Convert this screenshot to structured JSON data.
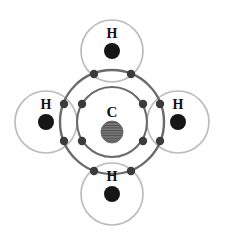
{
  "figure": {
    "background_color": "#ffffff"
  },
  "colors": {
    "carbon_shell_stroke": "#6a6a6a",
    "hydrogen_shell_stroke": "#bcbcbc",
    "electron_dot": "#3a3a3a",
    "carbon_nucleus": "#7a7a7a",
    "carbon_nucleus_hatch": "#4a4a4a",
    "hydrogen_nucleus": "#141414",
    "label_color": "#111111"
  },
  "central_atom": {
    "symbol": "C",
    "label_x": 112,
    "label_y": 117,
    "center_x": 112,
    "center_y": 122,
    "nucleus_radius": 11,
    "inner_shell_radius": 35,
    "outer_shell_radius": 52
  },
  "hydrogens": [
    {
      "id": "hydrogen-top",
      "symbol": "H",
      "center_x": 112,
      "center_y": 51,
      "radius": 31,
      "nucleus_radius": 8,
      "label_x": 112,
      "label_y": 38,
      "nucleus_x": 112,
      "nucleus_y": 51
    },
    {
      "id": "hydrogen-right",
      "symbol": "H",
      "center_x": 178,
      "center_y": 122,
      "radius": 31,
      "nucleus_radius": 8,
      "label_x": 178,
      "label_y": 109,
      "nucleus_x": 178,
      "nucleus_y": 122
    },
    {
      "id": "hydrogen-bottom",
      "symbol": "H",
      "center_x": 112,
      "center_y": 194,
      "radius": 31,
      "nucleus_radius": 8,
      "label_x": 112,
      "label_y": 181,
      "nucleus_x": 112,
      "nucleus_y": 194
    },
    {
      "id": "hydrogen-left",
      "symbol": "H",
      "center_x": 46,
      "center_y": 122,
      "radius": 31,
      "nucleus_radius": 8,
      "label_x": 46,
      "label_y": 109,
      "nucleus_x": 46,
      "nucleus_y": 122
    }
  ],
  "electron_pairs": [
    {
      "id": "bonding-pair-top",
      "bond_to": "hydrogen-top",
      "dots": [
        {
          "x": 94,
          "y": 74,
          "r": 4.2
        },
        {
          "x": 131,
          "y": 74,
          "r": 4.2
        }
      ]
    },
    {
      "id": "bonding-pair-right",
      "bond_to": "hydrogen-right",
      "dots": [
        {
          "x": 160,
          "y": 104,
          "r": 4.2
        },
        {
          "x": 160,
          "y": 141,
          "r": 4.2
        }
      ]
    },
    {
      "id": "bonding-pair-bottom",
      "bond_to": "hydrogen-bottom",
      "dots": [
        {
          "x": 94,
          "y": 171,
          "r": 4.2
        },
        {
          "x": 131,
          "y": 171,
          "r": 4.2
        }
      ]
    },
    {
      "id": "bonding-pair-left",
      "bond_to": "hydrogen-left",
      "dots": [
        {
          "x": 64,
          "y": 104,
          "r": 4.2
        },
        {
          "x": 64,
          "y": 141,
          "r": 4.2
        }
      ]
    }
  ],
  "inner_shell_dots": [
    {
      "x": 82,
      "y": 104,
      "r": 4.2
    },
    {
      "x": 143,
      "y": 104,
      "r": 4.2
    },
    {
      "x": 82,
      "y": 141,
      "r": 4.2
    },
    {
      "x": 143,
      "y": 141,
      "r": 4.2
    }
  ],
  "counts": {
    "hydrogen_atoms": 4,
    "valence_electron_dots": 8,
    "inner_shell_dots": 4
  }
}
